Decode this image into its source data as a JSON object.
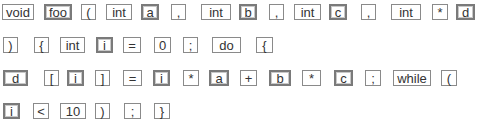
{
  "style": {
    "plain_border": "#8a8a8a",
    "ident_border": "#7a7a7a",
    "text": "#333333"
  },
  "rows": [
    {
      "y": 4,
      "tokens": [
        {
          "text": "void",
          "kind": "plain",
          "x": 2,
          "w": 32
        },
        {
          "text": "foo",
          "kind": "ident",
          "x": 44,
          "w": 28
        },
        {
          "text": "(",
          "kind": "plain",
          "x": 81,
          "w": 15
        },
        {
          "text": "int",
          "kind": "plain",
          "x": 106,
          "w": 26
        },
        {
          "text": "a",
          "kind": "ident",
          "x": 141,
          "w": 18
        },
        {
          "text": ",",
          "kind": "plain",
          "x": 171,
          "w": 15
        },
        {
          "text": "int",
          "kind": "plain",
          "x": 201,
          "w": 30
        },
        {
          "text": "b",
          "kind": "ident",
          "x": 239,
          "w": 18
        },
        {
          "text": ",",
          "kind": "plain",
          "x": 269,
          "w": 15
        },
        {
          "text": "int",
          "kind": "plain",
          "x": 294,
          "w": 27
        },
        {
          "text": "c",
          "kind": "ident",
          "x": 329,
          "w": 18
        },
        {
          "text": ",",
          "kind": "plain",
          "x": 361,
          "w": 15
        },
        {
          "text": "int",
          "kind": "plain",
          "x": 391,
          "w": 30
        },
        {
          "text": "*",
          "kind": "plain",
          "x": 432,
          "w": 16
        },
        {
          "text": "d",
          "kind": "ident",
          "x": 456,
          "w": 19
        }
      ]
    },
    {
      "y": 37,
      "tokens": [
        {
          "text": ")",
          "kind": "plain",
          "x": 3,
          "w": 15
        },
        {
          "text": "{",
          "kind": "plain",
          "x": 34,
          "w": 15
        },
        {
          "text": "int",
          "kind": "plain",
          "x": 60,
          "w": 25
        },
        {
          "text": "i",
          "kind": "ident",
          "x": 96,
          "w": 17
        },
        {
          "text": "=",
          "kind": "plain",
          "x": 123,
          "w": 18
        },
        {
          "text": "0",
          "kind": "plain",
          "x": 154,
          "w": 17
        },
        {
          "text": ";",
          "kind": "plain",
          "x": 183,
          "w": 15
        },
        {
          "text": "do",
          "kind": "plain",
          "x": 212,
          "w": 29
        },
        {
          "text": "{",
          "kind": "plain",
          "x": 256,
          "w": 17
        }
      ]
    },
    {
      "y": 70,
      "tokens": [
        {
          "text": "d",
          "kind": "ident",
          "x": 3,
          "w": 25
        },
        {
          "text": "[",
          "kind": "plain",
          "x": 44,
          "w": 15
        },
        {
          "text": "i",
          "kind": "ident",
          "x": 67,
          "w": 17
        },
        {
          "text": "]",
          "kind": "plain",
          "x": 95,
          "w": 15
        },
        {
          "text": "=",
          "kind": "plain",
          "x": 123,
          "w": 19
        },
        {
          "text": "i",
          "kind": "ident",
          "x": 153,
          "w": 17
        },
        {
          "text": "*",
          "kind": "plain",
          "x": 183,
          "w": 16
        },
        {
          "text": "a",
          "kind": "ident",
          "x": 209,
          "w": 20
        },
        {
          "text": "+",
          "kind": "plain",
          "x": 240,
          "w": 17
        },
        {
          "text": "b",
          "kind": "ident",
          "x": 269,
          "w": 22
        },
        {
          "text": "*",
          "kind": "plain",
          "x": 302,
          "w": 19
        },
        {
          "text": "c",
          "kind": "ident",
          "x": 334,
          "w": 19
        },
        {
          "text": ";",
          "kind": "plain",
          "x": 365,
          "w": 16
        },
        {
          "text": "while",
          "kind": "plain",
          "x": 393,
          "w": 38
        },
        {
          "text": "(",
          "kind": "plain",
          "x": 441,
          "w": 16
        }
      ]
    },
    {
      "y": 103,
      "tokens": [
        {
          "text": "i",
          "kind": "ident",
          "x": 3,
          "w": 17
        },
        {
          "text": "<",
          "kind": "plain",
          "x": 33,
          "w": 16
        },
        {
          "text": "10",
          "kind": "plain",
          "x": 60,
          "w": 26
        },
        {
          "text": ")",
          "kind": "plain",
          "x": 95,
          "w": 15
        },
        {
          "text": ";",
          "kind": "plain",
          "x": 124,
          "w": 17
        },
        {
          "text": "}",
          "kind": "plain",
          "x": 154,
          "w": 16
        }
      ]
    }
  ]
}
